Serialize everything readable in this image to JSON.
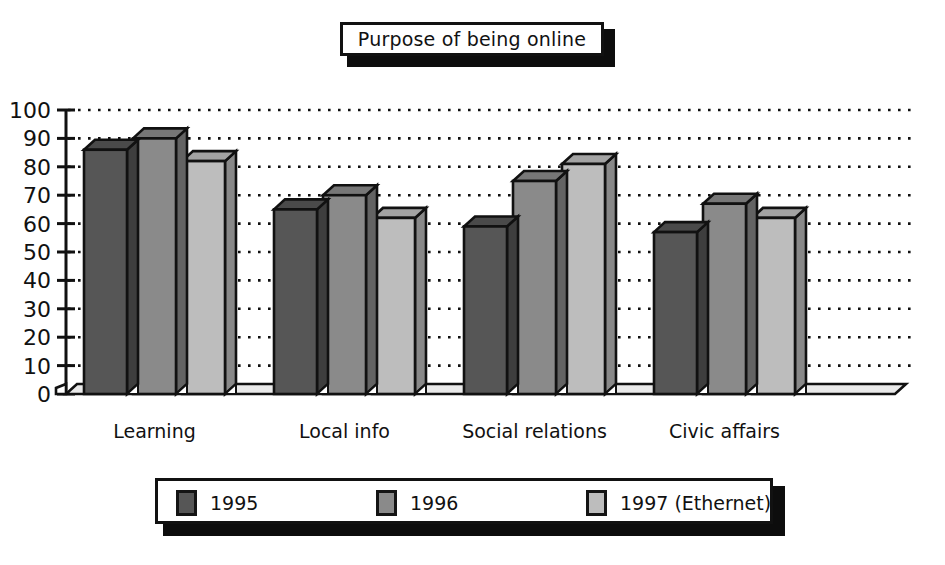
{
  "title": {
    "text": "Purpose of being online"
  },
  "chart_data": {
    "type": "bar",
    "title": "Purpose of being online",
    "xlabel": "",
    "ylabel": "",
    "ylim": [
      0,
      100
    ],
    "ytick_labels": [
      "100",
      "90",
      "80",
      "70",
      "60",
      "50",
      "40",
      "30",
      "20",
      "10",
      "0"
    ],
    "yticks": [
      100,
      90,
      80,
      70,
      60,
      50,
      40,
      30,
      20,
      10,
      0
    ],
    "grid": true,
    "grid_style": "dotted-horizontal",
    "legend_position": "bottom",
    "categories": [
      "Learning",
      "Local info",
      "Social relations",
      "Civic affairs"
    ],
    "series": [
      {
        "name": "1995",
        "color": "#565656",
        "values": [
          86,
          65,
          59,
          57
        ]
      },
      {
        "name": "1996",
        "color": "#8a8a8a",
        "values": [
          90,
          70,
          75,
          67
        ]
      },
      {
        "name": "1997 (Ethernet)",
        "color": "#bdbdbd",
        "values": [
          82,
          62,
          81,
          62
        ]
      }
    ]
  },
  "legend": {
    "items": [
      {
        "label": "1995",
        "color": "#565656"
      },
      {
        "label": "1996",
        "color": "#8a8a8a"
      },
      {
        "label": "1997 (Ethernet)",
        "color": "#bdbdbd"
      }
    ]
  },
  "colors": {
    "series_1995": "#565656",
    "series_1996": "#8a8a8a",
    "series_1997": "#bdbdbd",
    "outline": "#111111",
    "background": "#ffffff",
    "shadow": "#0d0d0d",
    "floor": "#e9e9e9"
  }
}
